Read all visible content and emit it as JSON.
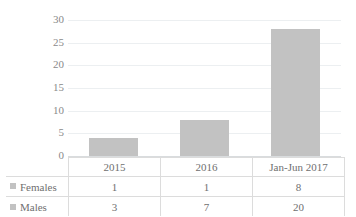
{
  "chart_data": {
    "type": "bar",
    "title": "",
    "subtitle": "",
    "xlabel": "",
    "ylabel": "",
    "categories": [
      "2015",
      "2016",
      "Jan-Jun 2017"
    ],
    "values": [
      4,
      8,
      28
    ],
    "ylim": [
      0,
      30
    ],
    "y_ticks": [
      30,
      25,
      20,
      15,
      10,
      5,
      0
    ],
    "grid": true,
    "legend_position": "data-table",
    "note": "Bars plot the combined total of Females + Males for each period; the attached data table lists each series.",
    "series": [
      {
        "name": "Females",
        "values": [
          1,
          1,
          8
        ]
      },
      {
        "name": "Males",
        "values": [
          3,
          7,
          20
        ]
      },
      {
        "name": "Total",
        "values": [
          4,
          8,
          28
        ]
      }
    ],
    "colors": {
      "bar_fill": "#c2c2c2",
      "gridline": "#eceff1",
      "axis": "#d9dcde",
      "text": "#7a7a7a",
      "table_border": "#dcdcdc"
    }
  },
  "data_table": {
    "column_headers": [
      "",
      "2015",
      "2016",
      "Jan-Jun 2017"
    ],
    "rows": [
      {
        "series": "Females",
        "cells": [
          "1",
          "1",
          "8"
        ]
      },
      {
        "series": "Males",
        "cells": [
          "3",
          "7",
          "20"
        ]
      }
    ]
  },
  "artifacts": {
    "bleed_line_1": "",
    "bleed_line_2": ""
  }
}
